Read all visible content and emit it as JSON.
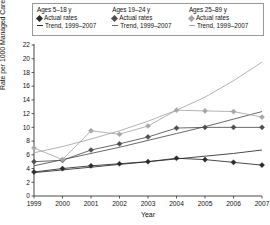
{
  "legend": {
    "groups": [
      {
        "title": "Ages 5–18 y",
        "actual_label": "Actual rates",
        "trend_label": "Trend, 1999–2007",
        "marker": "diamond-dark",
        "color": "#2b2b2b"
      },
      {
        "title": "Ages 19–24 y",
        "actual_label": "Actual rates",
        "trend_label": "Trend, 1999–2007",
        "marker": "diamond-mid",
        "color": "#4f4f4f"
      },
      {
        "title": "Ages 25–89 y",
        "actual_label": "Actual rates",
        "trend_label": "Trend, 1999–2007",
        "marker": "diamond-light",
        "color": "#a6a6a6"
      }
    ]
  },
  "chart_data": {
    "type": "line",
    "title": "",
    "xlabel": "Year",
    "ylabel": "Rate per 1000 Managed Care Enrollees",
    "x": [
      1999,
      2000,
      2001,
      2002,
      2003,
      2004,
      2005,
      2006,
      2007
    ],
    "xtick_labels": [
      "1999",
      "2000",
      "2001",
      "2002",
      "2003",
      "2004",
      "2005",
      "2006",
      "2007"
    ],
    "ytick_labels": [
      "0",
      "2",
      "4",
      "6",
      "8",
      "10",
      "12",
      "14",
      "16",
      "18",
      "20",
      "22"
    ],
    "ylim": [
      0,
      22
    ],
    "ytick_step": 2,
    "grid": false,
    "legend_position": "top",
    "series": [
      {
        "name": "Ages 5–18 y",
        "kind": "actual",
        "color": "#2b2b2b",
        "marker": "diamond",
        "values": [
          3.5,
          4.0,
          4.4,
          4.7,
          5.0,
          5.5,
          5.3,
          4.9,
          4.5
        ]
      },
      {
        "name": "Ages 19–24 y",
        "kind": "actual",
        "color": "#4f4f4f",
        "marker": "diamond",
        "values": [
          5.0,
          5.2,
          6.7,
          7.6,
          8.6,
          9.9,
          10.0,
          10.0,
          10.0
        ]
      },
      {
        "name": "Ages 25–89 y",
        "kind": "actual",
        "color": "#a6a6a6",
        "marker": "diamond",
        "values": [
          7.0,
          5.3,
          9.5,
          9.0,
          10.2,
          12.5,
          12.4,
          12.3,
          11.5
        ]
      },
      {
        "name": "Trend, 1999–2007 (Ages 5–18 y)",
        "kind": "trend",
        "color": "#2b2b2b",
        "values": [
          3.4,
          3.8,
          4.2,
          4.6,
          5.0,
          5.4,
          5.8,
          6.2,
          6.7
        ]
      },
      {
        "name": "Trend, 1999–2007 (Ages 19–24 y)",
        "kind": "trend",
        "color": "#4f4f4f",
        "values": [
          4.4,
          5.3,
          6.2,
          7.1,
          8.1,
          9.1,
          10.1,
          11.2,
          12.3
        ]
      },
      {
        "name": "Trend, 1999–2007 (Ages 25–89 y)",
        "kind": "trend",
        "color": "#a6a6a6",
        "values": [
          6.3,
          7.2,
          8.3,
          9.5,
          10.9,
          12.5,
          14.4,
          16.8,
          19.5
        ]
      }
    ]
  }
}
